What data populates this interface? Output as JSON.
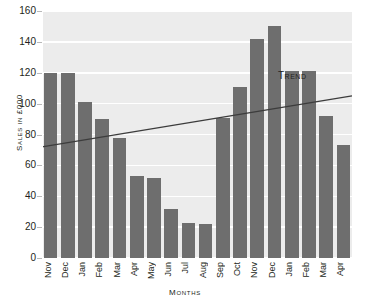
{
  "chart_data": {
    "type": "bar",
    "title": "",
    "xlabel": "Months",
    "ylabel": "Sales in £000",
    "ylim": [
      0,
      160
    ],
    "yticks": [
      0,
      20,
      40,
      60,
      80,
      100,
      120,
      140,
      160
    ],
    "grid": true,
    "legend_position": "inline-annotation",
    "categories": [
      "Nov",
      "Dec",
      "Jan",
      "Feb",
      "Mar",
      "Apr",
      "May",
      "Jun",
      "Jul",
      "Aug",
      "Sep",
      "Oct",
      "Nov",
      "Dec",
      "Jan",
      "Feb",
      "Mar",
      "Apr"
    ],
    "series": [
      {
        "name": "Sales",
        "type": "bar",
        "color": "#6e6e6e",
        "values": [
          120,
          120,
          101,
          90,
          78,
          53,
          52,
          32,
          23,
          22,
          91,
          111,
          142,
          150,
          121,
          121,
          92,
          73
        ]
      },
      {
        "name": "Trend",
        "type": "line",
        "color": "#3c3c3c",
        "annotation": "Trend",
        "endpoints": [
          72,
          105
        ]
      }
    ],
    "colors": {
      "bar": "#6e6e6e",
      "plot_background": "#f2f2f2",
      "band": "#ececec",
      "gridline": "#ffffff",
      "trend_line": "#3c3c3c",
      "text": "#231f20",
      "page_background": "#ffffff"
    }
  }
}
